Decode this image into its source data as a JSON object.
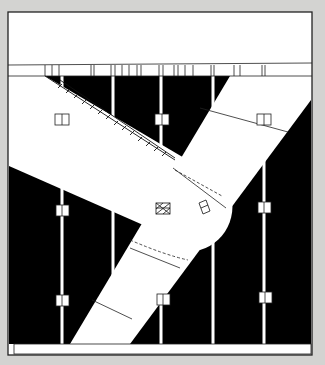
{
  "figure": {
    "kind": "architectural plan",
    "colors": {
      "background": "#d3d3d1",
      "paper": "#ffffff",
      "ink": "#000000",
      "line": "#1a1a1a"
    },
    "elements": {
      "top_band": "white strip",
      "beam_strip": "segmented horizontal beam with tick marks",
      "rounded_slab": "wide band with semicircular end and serrated (stair) edge",
      "diagonal_band": "straight band crossing from upper right to lower left",
      "columns_count": 5,
      "column_markers": 8,
      "hatched_box": "cross-hatched square marker",
      "bottom_band": "white strip"
    }
  }
}
